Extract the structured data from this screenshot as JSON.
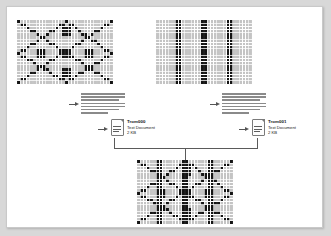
{
  "canvas": {
    "width": 331,
    "height": 236,
    "background": "#d8d8d8",
    "page_background": "#ffffff",
    "border_color": "#c9c9c9"
  },
  "diagram": {
    "title": "",
    "ink_color": "#141414",
    "grid_line_color": "#ffffff",
    "connector_color": "#5a5a5a"
  },
  "patterns": {
    "source_a": {
      "name": "x-cross-pattern",
      "cols": 30,
      "rows": 20,
      "cell": 3.2,
      "type": "diagonal-cross"
    },
    "source_b": {
      "name": "vertical-stripe-pattern",
      "cols": 30,
      "rows": 20,
      "cell": 3.2,
      "type": "vertical-bars",
      "bar_columns": [
        6,
        7,
        14,
        15,
        22,
        23
      ]
    },
    "result": {
      "name": "merged-pattern",
      "cols": 30,
      "rows": 20,
      "cell": 3.2,
      "type": "union"
    }
  },
  "text_blocks": {
    "left": {
      "name": "text-preview-left",
      "lines": 7
    },
    "right": {
      "name": "text-preview-right",
      "lines": 7
    }
  },
  "files": [
    {
      "id": "file-left",
      "name": "Trom000",
      "type": "Text Document",
      "size": "2 KB"
    },
    {
      "id": "file-right",
      "name": "Trom001",
      "type": "Text Document",
      "size": "2 KB"
    }
  ],
  "arrows": {
    "a1": {
      "name": "arrow-pattern-a-to-text"
    },
    "a2": {
      "name": "arrow-text-to-file-left"
    },
    "a3": {
      "name": "arrow-pattern-b-to-text"
    },
    "a4": {
      "name": "arrow-text-to-file-right"
    }
  }
}
